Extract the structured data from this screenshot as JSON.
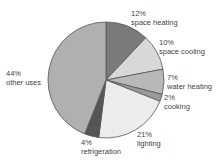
{
  "chart_data": {
    "type": "pie",
    "title": "",
    "start_angle_deg": 0,
    "direction": "clockwise",
    "slices": [
      {
        "label": "space heating",
        "value": 12,
        "pct_label": "12%",
        "color": "#7a7a7a"
      },
      {
        "label": "space cooling",
        "value": 10,
        "pct_label": "10%",
        "color": "#d8d8d8"
      },
      {
        "label": "water heating",
        "value": 7,
        "pct_label": "7%",
        "color": "#b8b8b8"
      },
      {
        "label": "cooking",
        "value": 2,
        "pct_label": "2%",
        "color": "#9a9a9a"
      },
      {
        "label": "lighting",
        "value": 21,
        "pct_label": "21%",
        "color": "#ececec"
      },
      {
        "label": "refrigeration",
        "value": 4,
        "pct_label": "4%",
        "color": "#555555"
      },
      {
        "label": "other uses",
        "value": 44,
        "pct_label": "44%",
        "color": "#b0b0b0"
      }
    ],
    "legend": "none (direct labels)",
    "outline_color": "#555555"
  },
  "labels": [
    {
      "pct": "12%",
      "name": "space heating"
    },
    {
      "pct": "10%",
      "name": "space cooling"
    },
    {
      "pct": "7%",
      "name": "water heating"
    },
    {
      "pct": "2%",
      "name": "cooking"
    },
    {
      "pct": "21%",
      "name": "lighting"
    },
    {
      "pct": "4%",
      "name": "refrigeration"
    },
    {
      "pct": "44%",
      "name": "other uses"
    }
  ]
}
